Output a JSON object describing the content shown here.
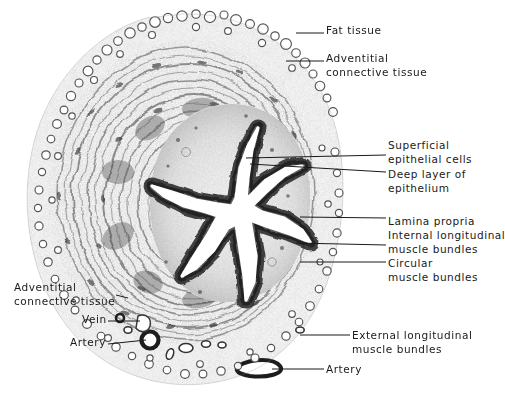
{
  "figure": {
    "type": "histology-micrograph-illustration",
    "background_color": "#ffffff",
    "ink_color": "#1a1a1a",
    "tissue_center": {
      "x": 182,
      "y": 205
    },
    "lumen": {
      "shape": "star",
      "arms": 6,
      "center": {
        "x": 232,
        "y": 208
      }
    }
  },
  "labels": [
    {
      "id": "fat-tissue",
      "text": "Fat tissue",
      "side": "right",
      "x": 326,
      "y": 24,
      "leader": [
        [
          296,
          33
        ],
        [
          324,
          33
        ]
      ]
    },
    {
      "id": "adventitial-connective-tissue-top",
      "text": "Adventitial\nconnective tissue",
      "side": "right",
      "x": 326,
      "y": 52,
      "leader": [
        [
          286,
          61
        ],
        [
          324,
          61
        ]
      ]
    },
    {
      "id": "superficial-epithelial-cells",
      "text": "Superficial\nepithelial cells",
      "side": "right",
      "x": 388,
      "y": 139,
      "leader": [
        [
          246,
          158
        ],
        [
          386,
          155
        ]
      ]
    },
    {
      "id": "deep-layer-of-epithelium",
      "text": "Deep layer of\nepithelium",
      "side": "right",
      "x": 388,
      "y": 168,
      "leader": [
        [
          250,
          164
        ],
        [
          386,
          172
        ]
      ]
    },
    {
      "id": "lamina-propria",
      "text": "Lamina propria",
      "side": "right",
      "x": 388,
      "y": 215,
      "leader": [
        [
          300,
          217
        ],
        [
          386,
          218
        ]
      ]
    },
    {
      "id": "internal-longitudinal-muscle-bundles",
      "text": "Internal longitudinal\nmuscle bundles",
      "side": "right",
      "x": 388,
      "y": 229,
      "leader": [
        [
          296,
          243
        ],
        [
          386,
          245
        ]
      ]
    },
    {
      "id": "circular-muscle-bundles",
      "text": "Circular\nmuscle bundles",
      "side": "right",
      "x": 388,
      "y": 257,
      "leader": [
        [
          300,
          262
        ],
        [
          386,
          262
        ]
      ]
    },
    {
      "id": "adventitial-connective-tissue-left",
      "text": "Adventitial\nconnective tissue",
      "side": "left",
      "x": 14,
      "y": 281,
      "leader": [
        [
          116,
          295
        ],
        [
          128,
          298
        ]
      ]
    },
    {
      "id": "vein",
      "text": "Vein",
      "side": "left",
      "x": 82,
      "y": 313,
      "leader": [
        [
          108,
          321
        ],
        [
          140,
          321
        ]
      ]
    },
    {
      "id": "artery-left",
      "text": "Artery",
      "side": "left",
      "x": 70,
      "y": 336,
      "leader": [
        [
          108,
          344
        ],
        [
          146,
          340
        ]
      ]
    },
    {
      "id": "external-longitudinal-muscle-bundles",
      "text": "External longitudinal\nmuscle bundles",
      "side": "right",
      "x": 352,
      "y": 329,
      "leader": [
        [
          300,
          335
        ],
        [
          350,
          335
        ]
      ]
    },
    {
      "id": "artery-bottom",
      "text": "Artery",
      "side": "right",
      "x": 326,
      "y": 363,
      "leader": [
        [
          272,
          369
        ],
        [
          324,
          369
        ]
      ]
    }
  ]
}
